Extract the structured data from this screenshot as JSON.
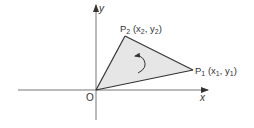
{
  "diagram": {
    "axes": {
      "x_label": "x",
      "y_label": "y",
      "origin_label": "O"
    },
    "points": [
      {
        "name": "P",
        "sub": "1",
        "coord_open": " (x",
        "coord_sub1": "1",
        "coord_mid": ", y",
        "coord_sub2": "1",
        "coord_close": ")"
      },
      {
        "name": "P",
        "sub": "2",
        "coord_open": " (x",
        "coord_sub1": "2",
        "coord_mid": ", y",
        "coord_sub2": "2",
        "coord_close": ")"
      }
    ],
    "colors": {
      "fill": "#e6e6e6",
      "stroke": "#333333",
      "axis": "#777777"
    },
    "rotation": "counterclockwise"
  }
}
